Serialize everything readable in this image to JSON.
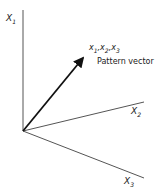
{
  "diagram": {
    "axes": [
      {
        "name": "X",
        "sub": "1"
      },
      {
        "name": "X",
        "sub": "2"
      },
      {
        "name": "X",
        "sub": "3"
      }
    ],
    "vector_label": {
      "parts": [
        "x",
        "1",
        ",x",
        "2",
        ",x",
        "3"
      ]
    },
    "vector_caption": "Pattern vector",
    "colors": {
      "line": "#333333",
      "vector": "#111111"
    }
  }
}
